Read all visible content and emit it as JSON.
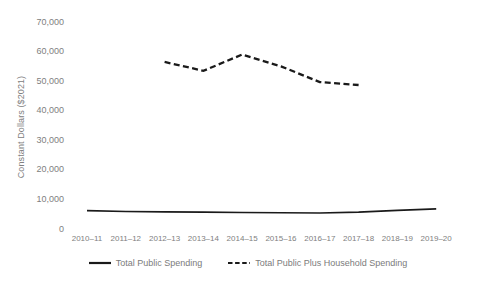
{
  "chart_data": {
    "type": "line",
    "title": "",
    "xlabel": "",
    "ylabel": "Constant Dollars ($2021)",
    "ylim": [
      0,
      70000
    ],
    "ytick_labels": [
      "70,000",
      "60,000",
      "50,000",
      "40,000",
      "30,000",
      "20,000",
      "10,000",
      "0"
    ],
    "ytick_values": [
      70000,
      60000,
      50000,
      40000,
      30000,
      20000,
      10000,
      0
    ],
    "grid": false,
    "legend_position": "bottom",
    "categories": [
      "2010–11",
      "2011–12",
      "2012–13",
      "2013–14",
      "2014–15",
      "2015–16",
      "2016–17",
      "2017–18",
      "2018–19",
      "2019–20"
    ],
    "series": [
      {
        "name": "Total Public Spending",
        "style": "solid",
        "color": "#1a1a1a",
        "values": [
          6200,
          5900,
          5800,
          5700,
          5600,
          5500,
          5400,
          5700,
          6300,
          6800
        ]
      },
      {
        "name": "Total Public Plus Household Spending",
        "style": "dashed",
        "color": "#1a1a1a",
        "values": [
          null,
          null,
          56500,
          53500,
          59000,
          55000,
          49700,
          48700,
          null,
          null
        ]
      }
    ]
  },
  "legend": {
    "items": [
      {
        "label": "Total Public Spending",
        "style": "solid"
      },
      {
        "label": "Total Public Plus Household Spending",
        "style": "dashed"
      }
    ]
  },
  "colors": {
    "line": "#1a1a1a",
    "text": "#808080",
    "background": "#ffffff"
  }
}
